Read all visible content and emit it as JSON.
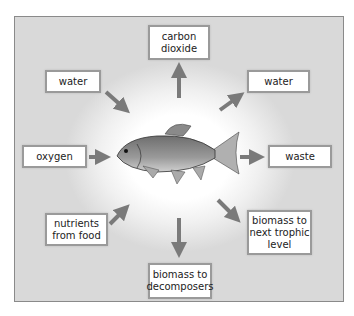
{
  "diagram": {
    "center": "fish",
    "inputs": [
      {
        "id": "water-in",
        "label": "water"
      },
      {
        "id": "oxygen",
        "label": "oxygen"
      },
      {
        "id": "nutrients",
        "label": "nutrients\nfrom food"
      }
    ],
    "outputs": [
      {
        "id": "carbon-dioxide",
        "label": "carbon\ndioxide"
      },
      {
        "id": "water-out",
        "label": "water"
      },
      {
        "id": "waste",
        "label": "waste"
      },
      {
        "id": "biomass-trophic",
        "label": "biomass to\nnext trophic\nlevel"
      },
      {
        "id": "biomass-decomposers",
        "label": "biomass to\ndecomposers"
      }
    ],
    "colors": {
      "arrow": "#7a7a7a",
      "box_border": "#9a9a9a",
      "background_edge": "#d9d9d9"
    }
  }
}
